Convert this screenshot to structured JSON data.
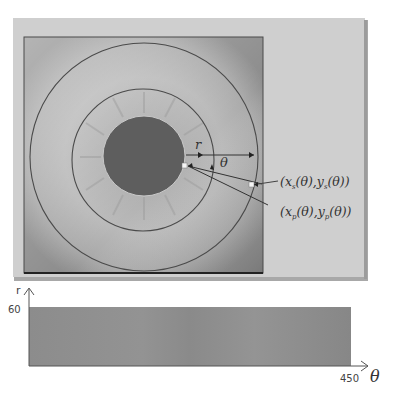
{
  "figure": {
    "type": "iris-normalization-diagram",
    "top_panel": {
      "description": "Iris image with pupil and iris boundary circles",
      "labels": {
        "radius": "r",
        "angle": "θ",
        "iris_boundary_point": "(x_s(θ), y_s(θ))",
        "pupil_boundary_point": "(x_p(θ), y_p(θ))"
      },
      "iris_point_label": {
        "x": "x",
        "x_sub": "s",
        "mid": "(θ),",
        "y": "y",
        "y_sub": "s",
        "end": "(θ))"
      },
      "pupil_point_label": {
        "x": "x",
        "x_sub": "p",
        "mid": "(θ),",
        "y": "y",
        "y_sub": "p",
        "end": "(θ))"
      }
    },
    "bottom_panel": {
      "description": "Unwrapped (normalized) iris strip",
      "y_axis_label": "r",
      "x_axis_label": "θ",
      "y_max_tick": "60",
      "x_max_tick": "450"
    },
    "colors": {
      "panel_bg": "#cfcfcf",
      "panel_shadow": "#a8a8a8",
      "iris_bg": "#b4b4b4",
      "pupil": "#5e5e5e",
      "circle_stroke": "#4a4a4a",
      "strip": "#8a8a8a",
      "axis": "#555555"
    }
  }
}
